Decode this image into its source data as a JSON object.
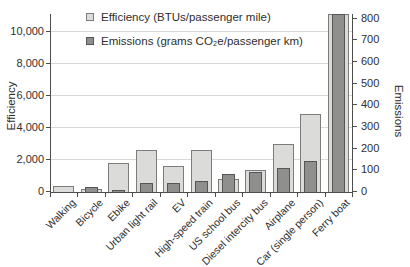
{
  "colors": {
    "efficiency_fill": "#dbdbd9",
    "efficiency_border": "#7c7c7a",
    "emissions_fill": "#8f8f8d",
    "emissions_border": "#565654",
    "gridline": "#d9d9d7",
    "axis_line": "#4d4d4b",
    "text": "#2e2e2e"
  },
  "chart_data": {
    "type": "bar",
    "title": "",
    "categories": [
      "Walking",
      "Bicycle",
      "Ebike",
      "Urban light rail",
      "EV",
      "High-speed train",
      "US school bus",
      "Diesel intercity bus",
      "Airplane",
      "Car (single person)",
      "Ferry boat"
    ],
    "series": [
      {
        "name": "Efficiency (BTUs/passenger mile)",
        "axis": "left",
        "values": [
          400,
          200,
          1800,
          2600,
          1600,
          2650,
          800,
          1400,
          3000,
          4900,
          11200
        ],
        "clipped_categories": [
          "Ferry boat"
        ]
      },
      {
        "name": "Emissions (grams CO₂e/passenger km)",
        "axis": "right",
        "values": [
          0,
          21,
          10,
          40,
          40,
          50,
          85,
          90,
          110,
          145,
          830
        ],
        "clipped_categories": [
          "Ferry boat"
        ]
      }
    ],
    "left_axis": {
      "title": "Efficiency",
      "min": 0,
      "max": 10000,
      "tick_step": 2000,
      "tick_labels": [
        "0",
        "2,000",
        "4,000",
        "6,000",
        "8,000",
        "10,000"
      ]
    },
    "right_axis": {
      "title": "Emissions",
      "min": 0,
      "max": 800,
      "tick_step": 100,
      "tick_labels": [
        "0",
        "100",
        "200",
        "300",
        "400",
        "500",
        "600",
        "700",
        "800"
      ]
    },
    "legend_position": "top-left-inside",
    "grid": "horizontal-light",
    "x_tick_label_rotation": -45
  }
}
